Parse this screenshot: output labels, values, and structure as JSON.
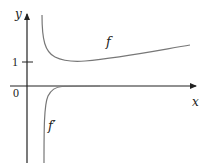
{
  "diagram": {
    "axes": {
      "x_label": "x",
      "y_label": "y",
      "origin_label": "0",
      "y_tick_label": "1",
      "axis_color": "#222222"
    },
    "curves": [
      {
        "name": "f",
        "label": "f",
        "color": "#777777",
        "description": "Starts high near the y-axis, decreases to a minimum above y=1, then slowly increases"
      },
      {
        "name": "f-prime",
        "label": "f′",
        "color": "#777777",
        "description": "Large negative near the y-axis, rises steeply and approaches 0 from below"
      }
    ]
  }
}
